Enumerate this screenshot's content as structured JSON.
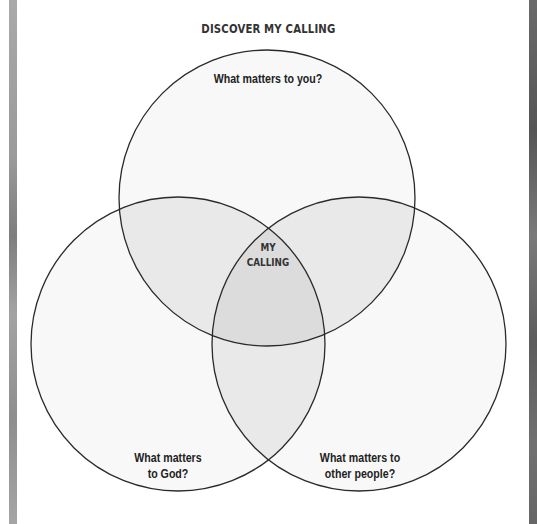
{
  "title": "DISCOVER MY CALLING",
  "diagram": {
    "type": "venn",
    "circles": [
      {
        "id": "top",
        "label": "What matters to you?",
        "cx": 267,
        "cy": 198,
        "r": 148
      },
      {
        "id": "bottom-left",
        "label": "What matters\nto God?",
        "cx": 178,
        "cy": 344,
        "r": 147
      },
      {
        "id": "bottom-right",
        "label": "What matters to\nother people?",
        "cx": 359,
        "cy": 344,
        "r": 147
      }
    ],
    "center_label": "MY\nCALLING",
    "colors": {
      "stroke": "#2a2a2a",
      "background": "#ffffff",
      "circle_fill": "#f7f7f7",
      "pair_overlap_fill": "#e9e9e9",
      "center_overlap_fill": "#dcdcdc"
    }
  }
}
